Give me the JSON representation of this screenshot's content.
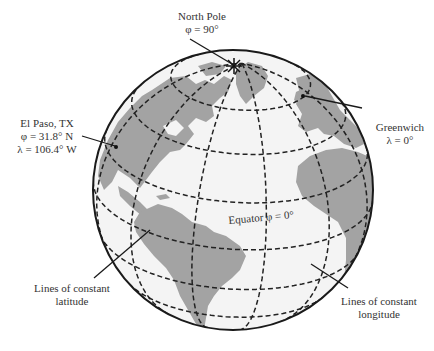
{
  "colors": {
    "land": "#a3a3a3",
    "ocean": "#f4f4f4",
    "outline": "#1a1a1a",
    "gridline": "#222222",
    "text": "#333333"
  },
  "labels": {
    "north_pole": {
      "name": "North Pole",
      "value": "φ = 90°"
    },
    "el_paso": {
      "name": "El Paso, TX",
      "latitude": "φ = 31.8° N",
      "longitude": "λ = 106.4° W"
    },
    "greenwich": {
      "name": "Greenwich",
      "value": "λ = 0°"
    },
    "equator": {
      "text": "Equator φ = 0°"
    },
    "latitude_lines": {
      "line1": "Lines of constant",
      "line2": "latitude"
    },
    "longitude_lines": {
      "line1": "Lines of constant",
      "line2": "longitude"
    }
  },
  "grid": {
    "latitudes_deg": [
      -40,
      -20,
      0,
      20,
      40,
      60
    ],
    "longitudes_deg": [
      -120,
      -90,
      -60,
      -30,
      0,
      30
    ],
    "view_center": {
      "lat": 25,
      "lon": -45
    }
  },
  "points": {
    "el_paso": {
      "lat": 31.8,
      "lon": -106.4
    }
  }
}
